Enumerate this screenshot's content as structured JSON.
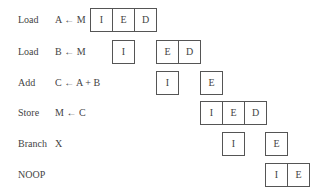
{
  "diagram": {
    "rows": [
      {
        "op": "Load",
        "arg": "A ← M",
        "stages": [
          "I",
          "E",
          "D"
        ]
      },
      {
        "op": "Load",
        "arg": "B ← M",
        "stages": [
          "I",
          "E",
          "D"
        ]
      },
      {
        "op": "Add",
        "arg": "C ← A + B",
        "stages": [
          "I",
          "E"
        ]
      },
      {
        "op": "Store",
        "arg": "M ← C",
        "stages": [
          "I",
          "E",
          "D"
        ]
      },
      {
        "op": "Branch",
        "arg": "X",
        "stages": [
          "I",
          "E"
        ]
      },
      {
        "op": "NOOP",
        "arg": "",
        "stages": [
          "I",
          "E"
        ]
      }
    ]
  }
}
